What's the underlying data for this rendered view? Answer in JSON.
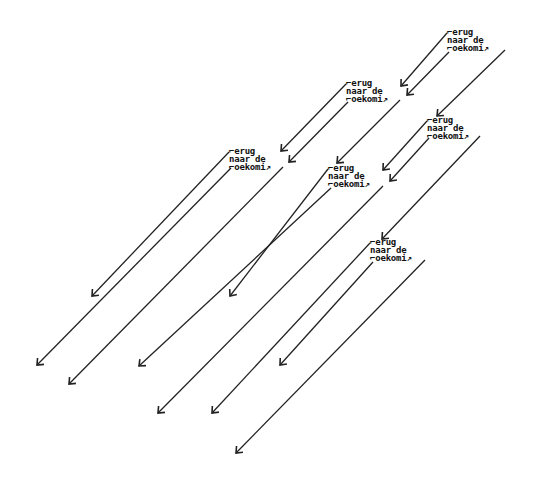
{
  "diagram": {
    "stroke_color": "#222222",
    "background": "#ffffff",
    "blocks": [
      {
        "id": "A",
        "x": 447,
        "y": 28,
        "lines": [
          "⌐erug",
          "naar de",
          "⌐oekomi↗"
        ]
      },
      {
        "id": "B",
        "x": 346,
        "y": 79,
        "lines": [
          "⌐erug",
          "naar de",
          "⌐oekomi↗"
        ]
      },
      {
        "id": "C",
        "x": 229,
        "y": 147,
        "lines": [
          "⌐erug",
          "naar de",
          "⌐oekomi↗"
        ]
      },
      {
        "id": "D",
        "x": 427,
        "y": 116,
        "lines": [
          "⌐erug",
          "naar de",
          "⌐oekomi↗"
        ]
      },
      {
        "id": "E",
        "x": 328,
        "y": 164,
        "lines": [
          "⌐erug",
          "naar de",
          "⌐oekomi↗"
        ]
      },
      {
        "id": "F",
        "x": 370,
        "y": 238,
        "lines": [
          "⌐erug",
          "naar de",
          "⌐oekomi↗"
        ]
      }
    ],
    "arrows": [
      {
        "from": "A",
        "x1": 447,
        "y1": 33,
        "x2": 401,
        "y2": 86
      },
      {
        "from": "A",
        "x1": 449,
        "y1": 52,
        "x2": 407,
        "y2": 95
      },
      {
        "from": "A",
        "x1": 505,
        "y1": 50,
        "x2": 437,
        "y2": 116
      },
      {
        "from": "B",
        "x1": 346,
        "y1": 84,
        "x2": 281,
        "y2": 151
      },
      {
        "from": "B",
        "x1": 348,
        "y1": 102,
        "x2": 289,
        "y2": 162
      },
      {
        "from": "B",
        "x1": 400,
        "y1": 100,
        "x2": 337,
        "y2": 163
      },
      {
        "from": "C",
        "x1": 229,
        "y1": 152,
        "x2": 92,
        "y2": 296
      },
      {
        "from": "C",
        "x1": 231,
        "y1": 168,
        "x2": 37,
        "y2": 365
      },
      {
        "from": "C",
        "x1": 283,
        "y1": 167,
        "x2": 69,
        "y2": 384
      },
      {
        "from": "D",
        "x1": 427,
        "y1": 121,
        "x2": 383,
        "y2": 170
      },
      {
        "from": "D",
        "x1": 429,
        "y1": 138,
        "x2": 390,
        "y2": 181
      },
      {
        "from": "D",
        "x1": 480,
        "y1": 136,
        "x2": 382,
        "y2": 239
      },
      {
        "from": "E",
        "x1": 328,
        "y1": 169,
        "x2": 230,
        "y2": 296
      },
      {
        "from": "E",
        "x1": 331,
        "y1": 188,
        "x2": 139,
        "y2": 366
      },
      {
        "from": "E",
        "x1": 383,
        "y1": 186,
        "x2": 158,
        "y2": 413
      },
      {
        "from": "F",
        "x1": 370,
        "y1": 243,
        "x2": 212,
        "y2": 413
      },
      {
        "from": "F",
        "x1": 373,
        "y1": 262,
        "x2": 280,
        "y2": 365
      },
      {
        "from": "F",
        "x1": 425,
        "y1": 260,
        "x2": 236,
        "y2": 453
      }
    ]
  }
}
